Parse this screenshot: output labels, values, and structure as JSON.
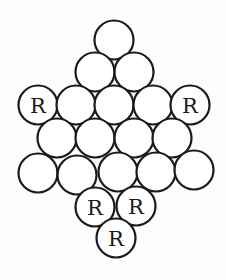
{
  "diagram": {
    "radius": 19.5,
    "stroke_color": "#1a1a1a",
    "fill_color": "#ffffff",
    "circles": [
      {
        "id": "r1c1",
        "x": 114,
        "y": 40,
        "label": ""
      },
      {
        "id": "r2c1",
        "x": 95,
        "y": 72,
        "label": ""
      },
      {
        "id": "r2c2",
        "x": 134,
        "y": 72,
        "label": ""
      },
      {
        "id": "r3c1",
        "x": 38,
        "y": 105,
        "label": "R"
      },
      {
        "id": "r3c2",
        "x": 76,
        "y": 105,
        "label": ""
      },
      {
        "id": "r3c3",
        "x": 114,
        "y": 105,
        "label": ""
      },
      {
        "id": "r3c4",
        "x": 153,
        "y": 105,
        "label": ""
      },
      {
        "id": "r3c5",
        "x": 190,
        "y": 105,
        "label": "R"
      },
      {
        "id": "r4c1",
        "x": 57,
        "y": 138,
        "label": ""
      },
      {
        "id": "r4c2",
        "x": 95,
        "y": 138,
        "label": ""
      },
      {
        "id": "r4c3",
        "x": 134,
        "y": 138,
        "label": ""
      },
      {
        "id": "r4c4",
        "x": 172,
        "y": 138,
        "label": ""
      },
      {
        "id": "r5c1",
        "x": 38,
        "y": 173,
        "label": ""
      },
      {
        "id": "r5c2",
        "x": 77,
        "y": 175,
        "label": ""
      },
      {
        "id": "r5c3",
        "x": 118,
        "y": 172,
        "label": ""
      },
      {
        "id": "r5c4",
        "x": 156,
        "y": 172,
        "label": ""
      },
      {
        "id": "r5c5",
        "x": 194,
        "y": 170,
        "label": ""
      },
      {
        "id": "r6c1",
        "x": 95,
        "y": 207,
        "label": "R"
      },
      {
        "id": "r6c2",
        "x": 136,
        "y": 206,
        "label": "R"
      },
      {
        "id": "r7c1",
        "x": 116,
        "y": 238,
        "label": "R"
      }
    ]
  }
}
